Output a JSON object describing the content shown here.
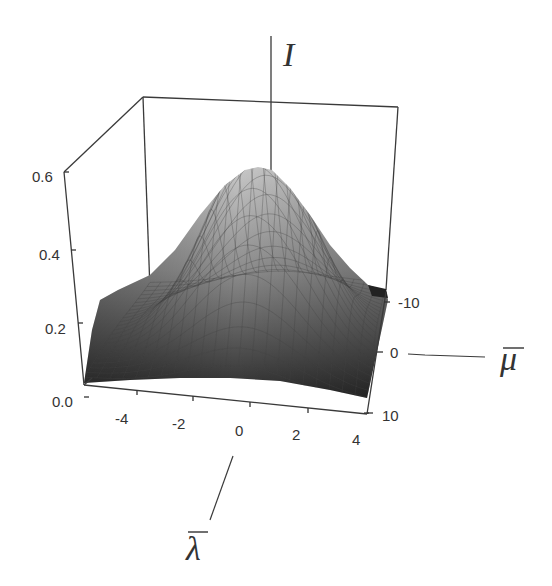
{
  "chart_data": {
    "type": "surface3d",
    "title": "",
    "axes": {
      "x": {
        "label": "λ̄",
        "symbol": "lambda-bar",
        "ticks": [
          -4,
          -2,
          0,
          2,
          4
        ],
        "tick_labels": [
          "-4",
          "-2",
          "0",
          "2",
          "4"
        ],
        "range": [
          -5,
          4
        ]
      },
      "y": {
        "label": "μ̄",
        "symbol": "mu-bar",
        "ticks": [
          -10,
          0,
          10
        ],
        "tick_labels": [
          "-10",
          "0",
          "10"
        ],
        "range": [
          -12,
          10
        ]
      },
      "z": {
        "label": "I",
        "ticks": [
          0.0,
          0.2,
          0.4,
          0.6
        ],
        "tick_labels": [
          "0.0",
          "0.2",
          "0.4",
          "0.6"
        ],
        "range": [
          0.0,
          0.6
        ]
      }
    },
    "surface": {
      "shape": "gaussian-peak",
      "peak": {
        "lambda": 0,
        "mu": 0,
        "I": 0.55
      },
      "edge_value_left_back": 0.28,
      "edge_value_right_back": 0.04,
      "min_value": 0.02,
      "color_top": "#bdbdbd",
      "color_bottom": "#2e2e2e",
      "mesh_lines": true
    },
    "grid": false,
    "legend": null,
    "box": true
  },
  "labels": {
    "z_axis": "I",
    "x_axis": "λ",
    "y_axis": "μ",
    "z_ticks": [
      "0.6",
      "0.4",
      "0.2",
      "0.0"
    ],
    "x_ticks": [
      "-4",
      "-2",
      "0",
      "2",
      "4"
    ],
    "y_ticks": [
      "-10",
      "0",
      "10"
    ]
  }
}
